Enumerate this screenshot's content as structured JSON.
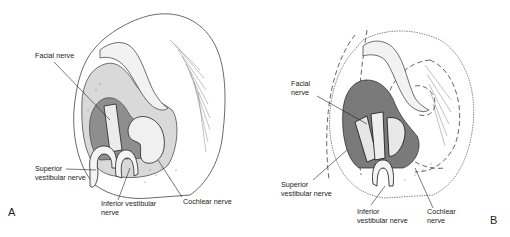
{
  "figure": {
    "panels": [
      {
        "id": "A",
        "letter": "A",
        "labels": {
          "facial": "Facial nerve",
          "superior_1": "Superior",
          "superior_2": "vestibular nerve",
          "inferior_1": "Inferior vestibular",
          "inferior_2": "nerve",
          "cochlear": "Cochlear nerve"
        }
      },
      {
        "id": "B",
        "letter": "B",
        "labels": {
          "facial_1": "Facial",
          "facial_2": "nerve",
          "superior_1": "Superior",
          "superior_2": "vestibular nerve",
          "inferior_1": "Inferior",
          "inferior_2": "vestibular nerve",
          "cochlear_1": "Cochlear",
          "cochlear_2": "nerve"
        }
      }
    ],
    "colors": {
      "ink": "#222222",
      "shade": "#9a9a9a",
      "background": "#ffffff"
    }
  }
}
